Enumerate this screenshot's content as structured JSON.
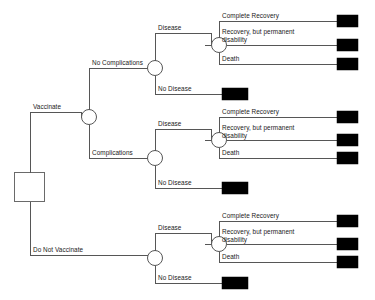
{
  "diagram": {
    "type": "decision-tree",
    "node_shapes": {
      "decision": "square",
      "chance": "circle",
      "terminal": "filled-rectangle"
    },
    "colors": {
      "line": "#565656",
      "terminal_fill": "#000000",
      "node_fill": "#ffffff",
      "background": "#ffffff",
      "text": "#1a1a1a"
    }
  },
  "labels": {
    "vaccinate": "Vaccinate",
    "do_not_vaccinate": "Do Not Vaccinate",
    "no_complications": "No Complications",
    "complications": "Complications",
    "disease_1": "Disease",
    "no_disease_1": "No Disease",
    "disease_2": "Disease",
    "no_disease_2": "No Disease",
    "disease_3": "Disease",
    "no_disease_3": "No Disease",
    "complete_recovery_1": "Complete Recovery",
    "recovery_disability_1": "Recovery, but permanent disability",
    "death_1": "Death",
    "complete_recovery_2": "Complete Recovery",
    "recovery_disability_2": "Recovery, but permanent disability",
    "death_2": "Death",
    "complete_recovery_3": "Complete Recovery",
    "recovery_disability_3": "Recovery, but permanent disability",
    "death_3": "Death"
  },
  "structure": {
    "root": {
      "name": "root-decision",
      "kind": "decision",
      "branches": [
        "Vaccinate",
        "Do Not Vaccinate"
      ]
    },
    "vaccinate_chance": {
      "name": "vaccinate-chance",
      "kind": "chance",
      "branches": [
        "No Complications",
        "Complications"
      ]
    },
    "no_complications_chance": {
      "name": "no-complications-chance",
      "kind": "chance",
      "branches": [
        "Disease",
        "No Disease"
      ]
    },
    "complications_chance": {
      "name": "complications-chance",
      "kind": "chance",
      "branches": [
        "Disease",
        "No Disease"
      ]
    },
    "do_not_vaccinate_chance": {
      "name": "do-not-vaccinate-chance",
      "kind": "chance",
      "branches": [
        "Disease",
        "No Disease"
      ]
    },
    "outcome_branches": [
      "Complete Recovery",
      "Recovery, but permanent disability",
      "Death"
    ],
    "terminal_count": 12
  }
}
